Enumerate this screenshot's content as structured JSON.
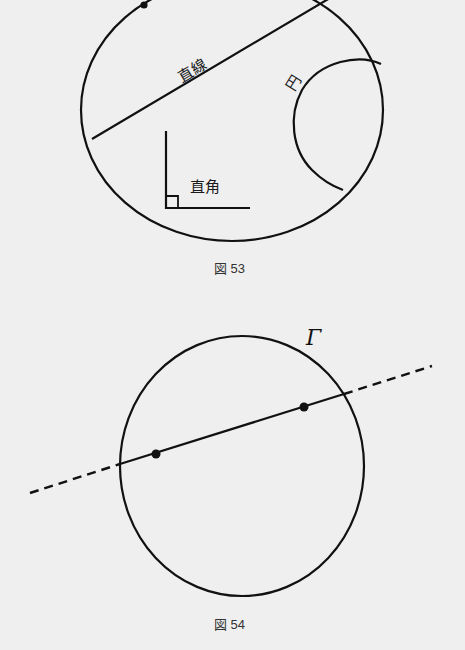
{
  "figure53": {
    "caption": "図 53",
    "labels": {
      "line": "直線",
      "circle": "円",
      "right_angle": "直角"
    }
  },
  "figure54": {
    "caption": "図 54",
    "circle_label": "Γ"
  },
  "colors": {
    "background": "#efefef",
    "stroke": "#111111"
  }
}
